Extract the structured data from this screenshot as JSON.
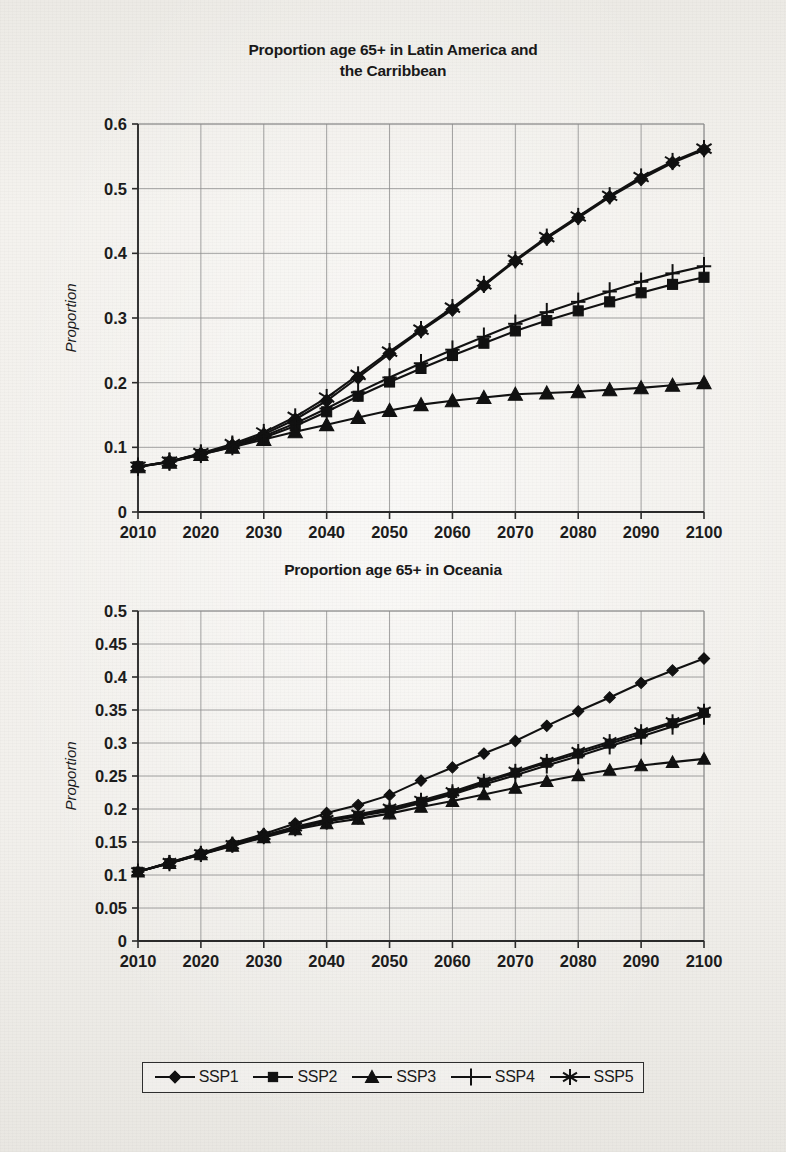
{
  "page": {
    "background_color": "#f0eeea",
    "ink_color": "#111111"
  },
  "charts": [
    {
      "id": "chart1",
      "title_lines": [
        "Proportion age 65+ in Latin America and",
        "the Carribbean"
      ],
      "ylabel": "Proportion",
      "xlabel": "",
      "ytick_labels": [
        "0",
        "0.1",
        "0.2",
        "0.3",
        "0.4",
        "0.5",
        "0.6"
      ],
      "xtick_labels": [
        "2010",
        "2020",
        "2030",
        "2040",
        "2050",
        "2060",
        "2070",
        "2080",
        "2090",
        "2100"
      ]
    },
    {
      "id": "chart2",
      "title_lines": [
        "Proportion age 65+ in Oceania"
      ],
      "ylabel": "Proportion",
      "xlabel": "",
      "ytick_labels": [
        "0",
        "0.05",
        "0.1",
        "0.15",
        "0.2",
        "0.25",
        "0.3",
        "0.35",
        "0.4",
        "0.45",
        "0.5"
      ],
      "xtick_labels": [
        "2010",
        "2020",
        "2030",
        "2040",
        "2050",
        "2060",
        "2070",
        "2080",
        "2090",
        "2100"
      ]
    }
  ],
  "legend": {
    "position": "bottom-center",
    "items": [
      {
        "label": "SSP1",
        "marker": "diamond"
      },
      {
        "label": "SSP2",
        "marker": "square"
      },
      {
        "label": "SSP3",
        "marker": "triangle"
      },
      {
        "label": "SSP4",
        "marker": "plus"
      },
      {
        "label": "SSP5",
        "marker": "asterisk"
      }
    ]
  },
  "chart_data": [
    {
      "type": "line",
      "title": "Proportion age 65+ in Latin America and the Carribbean",
      "xlabel": "",
      "ylabel": "Proportion",
      "grid": true,
      "legend_position": "bottom-center",
      "x": [
        2010,
        2015,
        2020,
        2025,
        2030,
        2035,
        2040,
        2045,
        2050,
        2055,
        2060,
        2065,
        2070,
        2075,
        2080,
        2085,
        2090,
        2095,
        2100
      ],
      "xlim": [
        2010,
        2100
      ],
      "ylim": [
        0,
        0.6
      ],
      "ytick_step": 0.1,
      "series": [
        {
          "name": "SSP1",
          "marker": "diamond",
          "values": [
            0.07,
            0.078,
            0.09,
            0.103,
            0.12,
            0.143,
            0.172,
            0.208,
            0.245,
            0.28,
            0.313,
            0.35,
            0.388,
            0.423,
            0.455,
            0.487,
            0.515,
            0.54,
            0.56
          ]
        },
        {
          "name": "SSP2",
          "marker": "square",
          "values": [
            0.07,
            0.077,
            0.089,
            0.101,
            0.115,
            0.133,
            0.155,
            0.179,
            0.201,
            0.222,
            0.242,
            0.261,
            0.28,
            0.296,
            0.311,
            0.325,
            0.339,
            0.352,
            0.363
          ]
        },
        {
          "name": "SSP3",
          "marker": "triangle",
          "values": [
            0.07,
            0.077,
            0.089,
            0.1,
            0.112,
            0.124,
            0.135,
            0.146,
            0.157,
            0.166,
            0.172,
            0.177,
            0.182,
            0.184,
            0.186,
            0.189,
            0.192,
            0.196,
            0.2
          ]
        },
        {
          "name": "SSP4",
          "marker": "plus",
          "values": [
            0.07,
            0.078,
            0.09,
            0.102,
            0.117,
            0.137,
            0.16,
            0.185,
            0.208,
            0.23,
            0.251,
            0.271,
            0.291,
            0.309,
            0.325,
            0.341,
            0.356,
            0.369,
            0.38
          ]
        },
        {
          "name": "SSP5",
          "marker": "asterisk",
          "values": [
            0.07,
            0.078,
            0.091,
            0.105,
            0.123,
            0.147,
            0.177,
            0.212,
            0.248,
            0.282,
            0.316,
            0.352,
            0.39,
            0.425,
            0.457,
            0.489,
            0.518,
            0.542,
            0.562
          ]
        }
      ]
    },
    {
      "type": "line",
      "title": "Proportion age 65+ in Oceania",
      "xlabel": "",
      "ylabel": "Proportion",
      "grid": true,
      "legend_position": "bottom-center",
      "x": [
        2010,
        2015,
        2020,
        2025,
        2030,
        2035,
        2040,
        2045,
        2050,
        2055,
        2060,
        2065,
        2070,
        2075,
        2080,
        2085,
        2090,
        2095,
        2100
      ],
      "xlim": [
        2010,
        2100
      ],
      "ylim": [
        0,
        0.5
      ],
      "ytick_step": 0.05,
      "series": [
        {
          "name": "SSP1",
          "marker": "diamond",
          "values": [
            0.105,
            0.119,
            0.133,
            0.148,
            0.162,
            0.178,
            0.194,
            0.206,
            0.221,
            0.243,
            0.263,
            0.284,
            0.303,
            0.326,
            0.348,
            0.369,
            0.391,
            0.41,
            0.428
          ]
        },
        {
          "name": "SSP2",
          "marker": "square",
          "values": [
            0.105,
            0.118,
            0.131,
            0.145,
            0.158,
            0.171,
            0.182,
            0.19,
            0.199,
            0.211,
            0.224,
            0.24,
            0.255,
            0.27,
            0.284,
            0.299,
            0.314,
            0.33,
            0.346
          ]
        },
        {
          "name": "SSP3",
          "marker": "triangle",
          "values": [
            0.105,
            0.118,
            0.131,
            0.144,
            0.157,
            0.169,
            0.178,
            0.185,
            0.193,
            0.203,
            0.212,
            0.222,
            0.232,
            0.242,
            0.251,
            0.259,
            0.266,
            0.271,
            0.276
          ]
        },
        {
          "name": "SSP4",
          "marker": "plus",
          "values": [
            0.105,
            0.118,
            0.132,
            0.146,
            0.159,
            0.171,
            0.181,
            0.189,
            0.197,
            0.209,
            0.222,
            0.237,
            0.251,
            0.266,
            0.28,
            0.295,
            0.31,
            0.325,
            0.34
          ]
        },
        {
          "name": "SSP5",
          "marker": "asterisk",
          "values": [
            0.105,
            0.119,
            0.132,
            0.146,
            0.16,
            0.173,
            0.184,
            0.192,
            0.201,
            0.213,
            0.226,
            0.242,
            0.257,
            0.272,
            0.287,
            0.302,
            0.317,
            0.332,
            0.348
          ]
        }
      ]
    }
  ]
}
